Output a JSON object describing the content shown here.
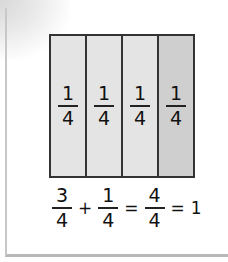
{
  "diagram": {
    "bars": [
      {
        "numerator": "1",
        "denominator": "4",
        "shade": "#e4e4e4"
      },
      {
        "numerator": "1",
        "denominator": "4",
        "shade": "#e4e4e4"
      },
      {
        "numerator": "1",
        "denominator": "4",
        "shade": "#e4e4e4"
      },
      {
        "numerator": "1",
        "denominator": "4",
        "shade": "#cfcfcf"
      }
    ],
    "equation": {
      "term1": {
        "numerator": "3",
        "denominator": "4"
      },
      "plus": "+",
      "term2": {
        "numerator": "1",
        "denominator": "4"
      },
      "equals1": "=",
      "term3": {
        "numerator": "4",
        "denominator": "4"
      },
      "equals2": "=",
      "result": "1"
    }
  }
}
